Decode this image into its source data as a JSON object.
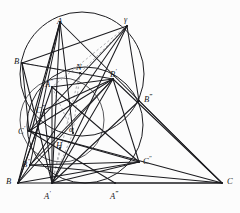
{
  "figure": {
    "header_artifact": "",
    "width": 240,
    "height": 213,
    "stroke_color": "#1c1c20",
    "dashed_color": "#9a9a9f",
    "background": "#fcfcfc"
  },
  "points": [
    {
      "id": "A",
      "label": "A",
      "prime": "",
      "x": 60,
      "y": 22,
      "lx": 57,
      "ly": 17
    },
    {
      "id": "gamma",
      "label": "γ",
      "prime": "",
      "x": 127,
      "y": 26,
      "lx": 124,
      "ly": 16
    },
    {
      "id": "Bbeta",
      "label": "B",
      "prime": "",
      "x": 22,
      "y": 63,
      "lx": 14,
      "ly": 57
    },
    {
      "id": "N",
      "label": "N",
      "prime": "",
      "x": 80,
      "y": 73,
      "lx": 76,
      "ly": 63
    },
    {
      "id": "Bp",
      "label": "B",
      "prime": "′",
      "x": 113,
      "y": 79,
      "lx": 110,
      "ly": 68
    },
    {
      "id": "App",
      "label": "A",
      "prime": "″",
      "x": 52,
      "y": 87,
      "lx": 45,
      "ly": 78
    },
    {
      "id": "Bppp",
      "label": "B",
      "prime": "‴",
      "x": 139,
      "y": 101,
      "lx": 144,
      "ly": 93
    },
    {
      "id": "Cppp",
      "label": "C",
      "prime": "‴",
      "x": 44,
      "y": 110,
      "lx": 36,
      "ly": 104
    },
    {
      "id": "Cp",
      "label": "C",
      "prime": "′",
      "x": 29,
      "y": 131,
      "lx": 18,
      "ly": 125
    },
    {
      "id": "alpha",
      "label": "α",
      "prime": "",
      "x": 73,
      "y": 133,
      "lx": 69,
      "ly": 126
    },
    {
      "id": "H",
      "label": "H",
      "prime": "",
      "x": 60,
      "y": 148,
      "lx": 56,
      "ly": 141
    },
    {
      "id": "Cpp",
      "label": "C",
      "prime": "″",
      "x": 139,
      "y": 162,
      "lx": 143,
      "ly": 155
    },
    {
      "id": "Bpp",
      "label": "B",
      "prime": "″",
      "x": 30,
      "y": 165,
      "lx": 22,
      "ly": 158
    },
    {
      "id": "B",
      "label": "B",
      "prime": "",
      "x": 18,
      "y": 183,
      "lx": 6,
      "ly": 177
    },
    {
      "id": "Ap",
      "label": "A",
      "prime": "′",
      "x": 52,
      "y": 183,
      "lx": 44,
      "ly": 190
    },
    {
      "id": "Appp",
      "label": "A",
      "prime": "‴",
      "x": 115,
      "y": 183,
      "lx": 110,
      "ly": 190
    },
    {
      "id": "C",
      "label": "C",
      "prime": "",
      "x": 222,
      "y": 183,
      "lx": 227,
      "ly": 177
    }
  ],
  "circles": [
    {
      "name": "circumcircle",
      "cx": 82,
      "cy": 74,
      "r": 62,
      "stroke": "#1c1c20",
      "width": 1.0
    },
    {
      "name": "nine-point-circle",
      "cx": 85,
      "cy": 125,
      "r": 58,
      "stroke": "#1c1c20",
      "width": 1.0
    },
    {
      "name": "left-small-circle",
      "cx": 62,
      "cy": 120,
      "r": 42,
      "stroke": "#3a3a3e",
      "width": 0.85
    }
  ],
  "solid_segments": [
    [
      "B",
      "C"
    ],
    [
      "B",
      "A"
    ],
    [
      "A",
      "C"
    ],
    [
      "A",
      "Ap"
    ],
    [
      "A",
      "Bpp"
    ],
    [
      "A",
      "Cp"
    ],
    [
      "A",
      "alpha"
    ],
    [
      "Bbeta",
      "gamma"
    ],
    [
      "Bbeta",
      "Cp"
    ],
    [
      "Bbeta",
      "Ap"
    ],
    [
      "Bbeta",
      "Bp"
    ],
    [
      "gamma",
      "Ap"
    ],
    [
      "gamma",
      "Cp"
    ],
    [
      "gamma",
      "B"
    ],
    [
      "gamma",
      "Bppp"
    ],
    [
      "Bp",
      "B"
    ],
    [
      "Bp",
      "Ap"
    ],
    [
      "Bp",
      "C"
    ],
    [
      "Bp",
      "Cp"
    ],
    [
      "Bp",
      "Cpp"
    ],
    [
      "Bp",
      "Bpp"
    ],
    [
      "Bp",
      "App"
    ],
    [
      "Bppp",
      "C"
    ],
    [
      "Bppp",
      "Ap"
    ],
    [
      "Cp",
      "Cpp"
    ],
    [
      "Cp",
      "C"
    ],
    [
      "Cp",
      "Appp"
    ],
    [
      "Cpp",
      "Ap"
    ],
    [
      "Cpp",
      "B"
    ],
    [
      "Bpp",
      "Cpp"
    ],
    [
      "Bpp",
      "C"
    ],
    [
      "B",
      "App"
    ],
    [
      "App",
      "Ap"
    ],
    [
      "App",
      "Cpp"
    ],
    [
      "Cppp",
      "Ap"
    ],
    [
      "Cppp",
      "Bp"
    ],
    [
      "Cppp",
      "B"
    ],
    [
      "Ap",
      "C"
    ]
  ],
  "dashed_segments": [
    [
      "Bbeta",
      "N"
    ],
    [
      "N",
      "gamma"
    ],
    [
      "N",
      "Ap"
    ],
    [
      "N",
      "alpha"
    ],
    [
      "gamma",
      "App"
    ],
    [
      "App",
      "alpha"
    ],
    [
      "alpha",
      "Ap"
    ],
    [
      "H",
      "Ap"
    ]
  ]
}
